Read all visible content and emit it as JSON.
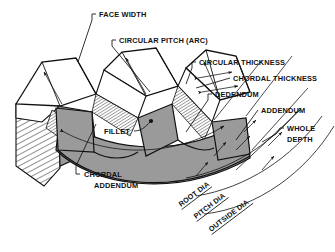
{
  "diagram": {
    "background_color": "#ffffff",
    "ink_color": "#111111",
    "tooth_face_fill": "#9a9a9a",
    "tooth_top_fill": "#ffffff",
    "hatch_color": "#333333"
  },
  "labels": {
    "face_width": "FACE WIDTH",
    "circular_pitch": "CIRCULAR PITCH  (ARC)",
    "circular_thickness": "CIRCULAR THICKNESS",
    "chordal_thickness": "CHORDAL THICKNESS",
    "dedendum": "DEDENDUM",
    "addendum": "ADDENDUM",
    "whole_depth_line1": "WHOLE",
    "whole_depth_line2": "DEPTH",
    "fillet": "FILLET",
    "chordal_addendum_line1": "CHORDAL",
    "chordal_addendum_line2": "ADDENDUM",
    "root_dia": "ROOT DIA",
    "pitch_dia": "PITCH DIA",
    "outside_dia": "OUTSIDE DIA"
  }
}
